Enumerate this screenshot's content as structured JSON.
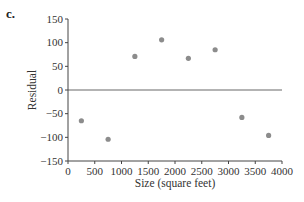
{
  "panel_label": "c.",
  "chart_data": {
    "type": "scatter",
    "title": "",
    "xlabel": "Size (square feet)",
    "ylabel": "Residual",
    "xlim": [
      0,
      4000
    ],
    "ylim": [
      -150,
      150
    ],
    "xticks": [
      0,
      500,
      1000,
      1500,
      2000,
      2500,
      3000,
      3500,
      4000
    ],
    "yticks": [
      150,
      100,
      50,
      0,
      -50,
      -100,
      -150
    ],
    "grid": false,
    "reference_line": {
      "y": 0,
      "color": "#9a9a9a"
    },
    "point_color": "#8c8c8c",
    "series": [
      {
        "name": "Residuals",
        "x": [
          250,
          750,
          1250,
          1750,
          2250,
          2750,
          3250,
          3750
        ],
        "y": [
          -65,
          -104,
          71,
          106,
          67,
          85,
          -58,
          -96
        ]
      }
    ]
  }
}
